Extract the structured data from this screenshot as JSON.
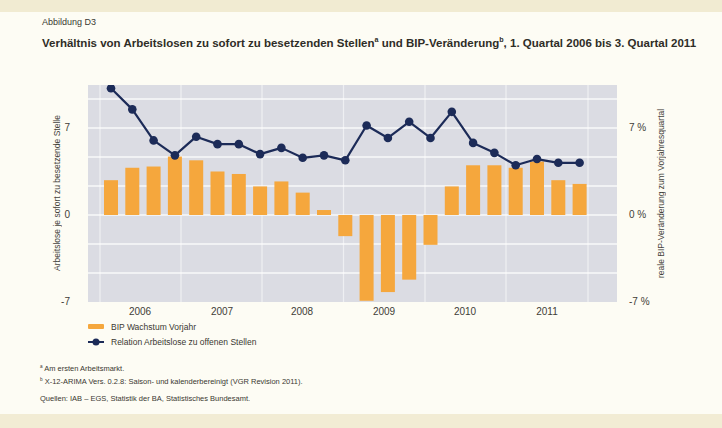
{
  "figure": {
    "label": "Abbildung D3"
  },
  "title": {
    "part1": "Verhältnis von Arbeitslosen zu sofort zu besetzenden Stellen",
    "sup1": "a",
    "part2": " und BIP-Veränderung",
    "sup2": "b",
    "part3": ", 1. Quartal 2006 bis 3. Quartal 2011"
  },
  "axes": {
    "left": {
      "label": "Arbeitslose je sofort zu besetzende Stelle",
      "ticks": [
        "7",
        "0",
        "-7"
      ]
    },
    "right": {
      "label": "reale BIP-Veränderung zum Vorjahresquartal",
      "ticks": [
        "7 %",
        "0 %",
        "-7 %"
      ]
    },
    "x": {
      "years": [
        "2006",
        "2007",
        "2008",
        "2009",
        "2010",
        "2011"
      ]
    }
  },
  "legend": {
    "bar_label": "BIP Wachstum Vorjahr",
    "line_label": "Relation Arbeitslose zu offenen Stellen"
  },
  "footnotes": {
    "a_sup": "a",
    "a_text": " Am ersten Arbeitsmarkt.",
    "b_sup": "b",
    "b_text": " X-12-ARIMA Vers. 0.2.8: Saison- und kalenderbereinigt (VGR Revision 2011).",
    "sources": "Quellen: IAB – EGS, Statistik der BA, Statistisches Bundesamt."
  },
  "colors": {
    "bar": "#f5a73d",
    "line": "#1c2b58",
    "plot_bg": "#dbdce3",
    "grid": "#ffffff"
  },
  "chart_data": {
    "type": "bar",
    "categories": [
      "2006 Q1",
      "2006 Q2",
      "2006 Q3",
      "2006 Q4",
      "2007 Q1",
      "2007 Q2",
      "2007 Q3",
      "2007 Q4",
      "2008 Q1",
      "2008 Q2",
      "2008 Q3",
      "2008 Q4",
      "2009 Q1",
      "2009 Q2",
      "2009 Q3",
      "2009 Q4",
      "2010 Q1",
      "2010 Q2",
      "2010 Q3",
      "2010 Q4",
      "2011 Q1",
      "2011 Q2",
      "2011 Q3"
    ],
    "series": [
      {
        "name": "BIP Wachstum Vorjahr",
        "type": "bar",
        "axis": "right",
        "unit": "%",
        "values": [
          2.8,
          3.8,
          3.9,
          4.7,
          4.4,
          3.5,
          3.3,
          2.3,
          2.7,
          1.8,
          0.4,
          -1.7,
          -6.9,
          -6.2,
          -5.2,
          -2.4,
          2.3,
          4.0,
          4.0,
          3.8,
          4.3,
          2.8,
          2.5
        ]
      },
      {
        "name": "Relation Arbeitslose zu offenen Stellen",
        "type": "line",
        "axis": "left",
        "values": [
          10.2,
          8.5,
          6.0,
          4.8,
          6.3,
          5.7,
          5.7,
          4.9,
          5.4,
          4.6,
          4.8,
          4.4,
          7.2,
          6.2,
          7.5,
          6.2,
          8.3,
          5.8,
          5.0,
          4.0,
          4.5,
          4.2,
          4.2
        ]
      }
    ],
    "ylabel_left": "Arbeitslose je sofort zu besetzende Stelle",
    "ylabel_right": "reale BIP-Veränderung zum Vorjahresquartal",
    "ylim": [
      -7,
      10.5
    ],
    "yticks": [
      -7,
      0,
      7
    ],
    "x_tick_labels": [
      "2006",
      "2007",
      "2008",
      "2009",
      "2010",
      "2011"
    ],
    "grid": true,
    "legend_position": "below-left"
  }
}
